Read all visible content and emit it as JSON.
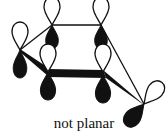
{
  "caption": "not planar",
  "colors": {
    "ink": "#111111",
    "background": "#ffffff"
  },
  "atoms": [
    {
      "id": "c1",
      "x": 20,
      "y": 50
    },
    {
      "id": "c2",
      "x": 52,
      "y": 25
    },
    {
      "id": "c3",
      "x": 101,
      "y": 25
    },
    {
      "id": "c4",
      "x": 48,
      "y": 72
    },
    {
      "id": "c5",
      "x": 103,
      "y": 74
    },
    {
      "id": "c6",
      "x": 144,
      "y": 104
    }
  ],
  "orbital_lobes": [
    "white (up)",
    "black (down)"
  ],
  "bonds": [
    {
      "from": "c1",
      "to": "c2",
      "style": "thin"
    },
    {
      "from": "c2",
      "to": "c3",
      "style": "thin"
    },
    {
      "from": "c3",
      "to": "c6",
      "style": "thin"
    },
    {
      "from": "c1",
      "to": "c4",
      "style": "wedge"
    },
    {
      "from": "c4",
      "to": "c5",
      "style": "bold"
    },
    {
      "from": "c5",
      "to": "c6",
      "style": "wedge"
    }
  ]
}
